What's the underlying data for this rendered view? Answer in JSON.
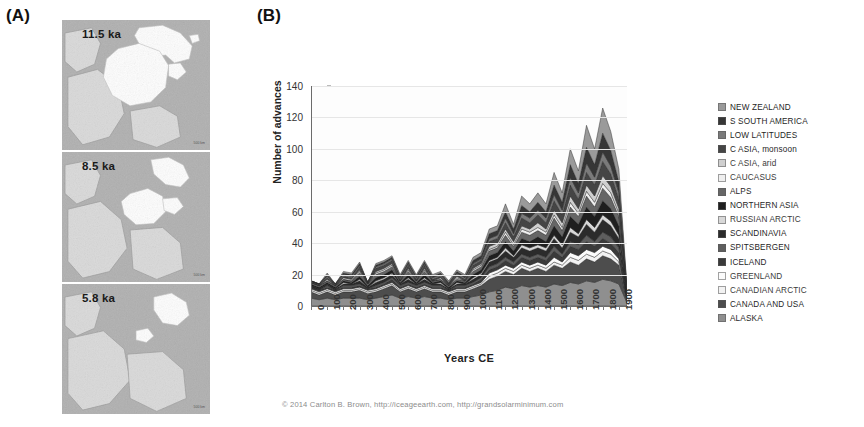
{
  "figure": {
    "panel_a_label": "(A)",
    "panel_b_label": "(B)",
    "caption": "© 2014 Carlton B. Brown, http://iceageearth.com, http://grandsolarminimum.com"
  },
  "panel_a": {
    "name": "ice-sheet-extent-maps",
    "tiles": [
      {
        "label": "11.5 ka",
        "scale_note": "500 km"
      },
      {
        "label": "8.5 ka",
        "scale_note": "500 km"
      },
      {
        "label": "5.8 ka",
        "scale_note": "500 km"
      }
    ]
  },
  "chart_data": {
    "type": "area",
    "title": "",
    "xlabel": "Years CE",
    "ylabel": "Number of advances",
    "ylim": [
      0,
      140
    ],
    "xlim": [
      0,
      1950
    ],
    "yticks": [
      0,
      20,
      40,
      60,
      80,
      100,
      120,
      140
    ],
    "xticks": [
      0,
      100,
      200,
      300,
      400,
      500,
      600,
      700,
      800,
      900,
      1000,
      1100,
      1200,
      1300,
      1400,
      1500,
      1600,
      1700,
      1800,
      1900
    ],
    "grid": true,
    "stacked": true,
    "legend_position": "right",
    "x": [
      0,
      50,
      100,
      150,
      200,
      250,
      300,
      350,
      400,
      450,
      500,
      550,
      600,
      650,
      700,
      750,
      800,
      850,
      900,
      950,
      1000,
      1050,
      1100,
      1150,
      1200,
      1250,
      1300,
      1350,
      1400,
      1450,
      1500,
      1550,
      1600,
      1650,
      1700,
      1750,
      1800,
      1850,
      1900,
      1950
    ],
    "series": [
      {
        "name": "ALASKA",
        "color": "#8f8f8f",
        "values": [
          5,
          4,
          5,
          4,
          5,
          5,
          5,
          4,
          5,
          6,
          7,
          5,
          6,
          5,
          6,
          5,
          5,
          4,
          5,
          5,
          6,
          7,
          9,
          10,
          12,
          11,
          13,
          12,
          13,
          12,
          14,
          13,
          15,
          14,
          16,
          15,
          17,
          16,
          14,
          2
        ]
      },
      {
        "name": "CANADA AND USA",
        "color": "#4d4d4d",
        "values": [
          4,
          3,
          4,
          3,
          4,
          4,
          5,
          4,
          4,
          5,
          6,
          4,
          5,
          4,
          5,
          4,
          4,
          3,
          4,
          4,
          5,
          6,
          8,
          9,
          10,
          9,
          11,
          10,
          11,
          10,
          12,
          11,
          13,
          12,
          14,
          13,
          15,
          14,
          12,
          2
        ]
      },
      {
        "name": "CANADIAN ARCTIC",
        "color": "#f2f2f2",
        "values": [
          1,
          1,
          1,
          1,
          1,
          1,
          1,
          1,
          1,
          1,
          1,
          1,
          1,
          1,
          1,
          1,
          1,
          1,
          1,
          1,
          1,
          1,
          2,
          2,
          2,
          2,
          2,
          2,
          2,
          2,
          2,
          2,
          3,
          3,
          3,
          3,
          3,
          3,
          2,
          0
        ]
      },
      {
        "name": "GREENLAND",
        "color": "#fbfbfb",
        "values": [
          1,
          1,
          1,
          1,
          1,
          1,
          1,
          1,
          1,
          1,
          1,
          1,
          1,
          1,
          1,
          1,
          1,
          1,
          1,
          1,
          1,
          1,
          2,
          2,
          2,
          2,
          2,
          2,
          2,
          2,
          3,
          2,
          3,
          3,
          3,
          3,
          3,
          3,
          2,
          0
        ]
      },
      {
        "name": "ICELAND",
        "color": "#3a3a3a",
        "values": [
          1,
          1,
          1,
          1,
          1,
          1,
          1,
          1,
          1,
          1,
          2,
          1,
          1,
          1,
          1,
          1,
          1,
          1,
          1,
          1,
          1,
          2,
          2,
          2,
          3,
          2,
          3,
          3,
          3,
          3,
          4,
          3,
          4,
          4,
          5,
          4,
          5,
          4,
          4,
          1
        ]
      },
      {
        "name": "SPITSBERGEN",
        "color": "#5e5e5e",
        "values": [
          0,
          0,
          1,
          0,
          1,
          1,
          1,
          0,
          1,
          1,
          1,
          1,
          1,
          1,
          1,
          1,
          1,
          0,
          1,
          1,
          1,
          1,
          2,
          2,
          2,
          2,
          2,
          2,
          2,
          2,
          3,
          2,
          3,
          3,
          4,
          3,
          4,
          4,
          3,
          0
        ]
      },
      {
        "name": "SCANDINAVIA",
        "color": "#2b2b2b",
        "values": [
          1,
          1,
          1,
          1,
          1,
          1,
          2,
          1,
          2,
          2,
          2,
          1,
          2,
          1,
          2,
          1,
          1,
          1,
          1,
          1,
          2,
          2,
          3,
          3,
          4,
          3,
          4,
          4,
          4,
          4,
          5,
          4,
          6,
          5,
          7,
          6,
          8,
          7,
          6,
          1
        ]
      },
      {
        "name": "RUSSIAN ARCTIC",
        "color": "#d8d8d8",
        "values": [
          0,
          0,
          0,
          0,
          1,
          0,
          1,
          0,
          1,
          1,
          1,
          0,
          1,
          0,
          1,
          0,
          1,
          0,
          1,
          0,
          1,
          1,
          1,
          1,
          2,
          1,
          2,
          2,
          2,
          2,
          2,
          2,
          3,
          2,
          3,
          3,
          3,
          3,
          2,
          0
        ]
      },
      {
        "name": "NORTHERN ASIA",
        "color": "#1f1f1f",
        "values": [
          1,
          1,
          1,
          1,
          1,
          1,
          2,
          1,
          2,
          2,
          2,
          1,
          2,
          1,
          2,
          1,
          1,
          1,
          1,
          1,
          2,
          2,
          3,
          3,
          4,
          3,
          4,
          4,
          5,
          4,
          6,
          5,
          7,
          6,
          8,
          7,
          9,
          8,
          6,
          1
        ]
      },
      {
        "name": "ALPS",
        "color": "#666666",
        "values": [
          1,
          1,
          1,
          1,
          1,
          1,
          2,
          1,
          2,
          2,
          2,
          1,
          2,
          1,
          2,
          1,
          1,
          1,
          1,
          1,
          2,
          2,
          3,
          3,
          4,
          3,
          4,
          4,
          4,
          4,
          5,
          4,
          6,
          5,
          7,
          6,
          8,
          7,
          6,
          1
        ]
      },
      {
        "name": "CAUCASUS",
        "color": "#efefef",
        "values": [
          0,
          0,
          0,
          0,
          0,
          0,
          1,
          0,
          1,
          1,
          1,
          0,
          1,
          0,
          1,
          0,
          0,
          0,
          1,
          0,
          1,
          1,
          1,
          1,
          2,
          1,
          2,
          2,
          2,
          2,
          2,
          2,
          3,
          2,
          3,
          3,
          3,
          3,
          2,
          0
        ]
      },
      {
        "name": "C ASIA, arid",
        "color": "#cfcfcf",
        "values": [
          0,
          0,
          1,
          0,
          1,
          1,
          1,
          0,
          1,
          1,
          1,
          0,
          1,
          0,
          1,
          0,
          1,
          0,
          1,
          0,
          1,
          1,
          2,
          2,
          2,
          2,
          2,
          2,
          3,
          2,
          3,
          3,
          4,
          3,
          4,
          4,
          5,
          4,
          3,
          0
        ]
      },
      {
        "name": "C ASIA, monsoon",
        "color": "#454545",
        "values": [
          1,
          1,
          1,
          1,
          1,
          1,
          2,
          1,
          2,
          2,
          2,
          1,
          2,
          1,
          2,
          1,
          1,
          1,
          1,
          1,
          2,
          2,
          3,
          3,
          4,
          3,
          5,
          4,
          5,
          4,
          6,
          5,
          7,
          6,
          8,
          7,
          9,
          8,
          6,
          1
        ]
      },
      {
        "name": "LOW LATITUDES",
        "color": "#7a7a7a",
        "values": [
          0,
          0,
          1,
          0,
          1,
          1,
          1,
          0,
          1,
          1,
          1,
          1,
          1,
          1,
          1,
          1,
          1,
          0,
          1,
          1,
          1,
          1,
          2,
          2,
          3,
          2,
          3,
          3,
          3,
          3,
          4,
          3,
          5,
          4,
          6,
          5,
          6,
          5,
          4,
          1
        ]
      },
      {
        "name": "S SOUTH AMERICA",
        "color": "#363636",
        "values": [
          0,
          0,
          1,
          0,
          1,
          1,
          1,
          0,
          1,
          1,
          1,
          1,
          1,
          1,
          1,
          1,
          1,
          1,
          1,
          1,
          2,
          2,
          3,
          3,
          4,
          3,
          5,
          4,
          5,
          4,
          6,
          5,
          8,
          6,
          10,
          8,
          12,
          10,
          7,
          1
        ]
      },
      {
        "name": "NEW ZEALAND",
        "color": "#9a9a9a",
        "values": [
          0,
          0,
          1,
          0,
          1,
          1,
          1,
          0,
          1,
          1,
          1,
          1,
          1,
          1,
          1,
          1,
          1,
          1,
          1,
          1,
          2,
          2,
          3,
          3,
          5,
          3,
          6,
          5,
          6,
          5,
          8,
          6,
          10,
          8,
          14,
          10,
          16,
          12,
          8,
          1
        ]
      }
    ],
    "legend": [
      {
        "label": "NEW ZEALAND",
        "color": "#9a9a9a",
        "style": "dark"
      },
      {
        "label": "S SOUTH AMERICA",
        "color": "#363636",
        "style": "dark"
      },
      {
        "label": "LOW LATITUDES",
        "color": "#7a7a7a",
        "style": "dark"
      },
      {
        "label": "C ASIA, monsoon",
        "color": "#454545",
        "style": "dark"
      },
      {
        "label": "C ASIA, arid",
        "color": "#cfcfcf",
        "style": "light"
      },
      {
        "label": "CAUCASUS",
        "color": "#efefef",
        "style": "light"
      },
      {
        "label": "ALPS",
        "color": "#666666",
        "style": "dark"
      },
      {
        "label": "NORTHERN ASIA",
        "color": "#1f1f1f",
        "style": "dark"
      },
      {
        "label": "RUSSIAN ARCTIC",
        "color": "#d8d8d8",
        "style": "light"
      },
      {
        "label": "SCANDINAVIA",
        "color": "#2b2b2b",
        "style": "dark"
      },
      {
        "label": "SPITSBERGEN",
        "color": "#5e5e5e",
        "style": "dark"
      },
      {
        "label": "ICELAND",
        "color": "#3a3a3a",
        "style": "dark"
      },
      {
        "label": "GREENLAND",
        "color": "#fbfbfb",
        "style": "light"
      },
      {
        "label": "CANADIAN ARCTIC",
        "color": "#f2f2f2",
        "style": "light"
      },
      {
        "label": "CANADA AND USA",
        "color": "#4d4d4d",
        "style": "dark"
      },
      {
        "label": "ALASKA",
        "color": "#8f8f8f",
        "style": "dark"
      }
    ]
  }
}
